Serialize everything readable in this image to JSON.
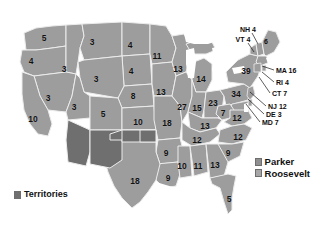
{
  "map": {
    "title": "1904 United States presidential election electoral map",
    "colors": {
      "roosevelt": "#9d9d9d",
      "parker": "#9d9d9d",
      "territories": "#6f6f6f",
      "background": "#ffffff",
      "border": "#e8e8e8",
      "text": "#111111"
    },
    "states": [
      {
        "name": "washington",
        "label": "5",
        "x": 44,
        "y": 38
      },
      {
        "name": "oregon",
        "label": "4",
        "x": 31,
        "y": 61
      },
      {
        "name": "idaho",
        "label": "3",
        "x": 64,
        "y": 69
      },
      {
        "name": "montana",
        "label": "3",
        "x": 92,
        "y": 42
      },
      {
        "name": "north-dakota",
        "label": "4",
        "x": 130,
        "y": 45
      },
      {
        "name": "south-dakota",
        "label": "4",
        "x": 131,
        "y": 71
      },
      {
        "name": "nebraska",
        "label": "8",
        "x": 133,
        "y": 96
      },
      {
        "name": "wyoming",
        "label": "3",
        "x": 96,
        "y": 79
      },
      {
        "name": "nevada",
        "label": "3",
        "x": 48,
        "y": 98
      },
      {
        "name": "california",
        "label": "10",
        "x": 33,
        "y": 119
      },
      {
        "name": "utah",
        "label": "3",
        "x": 74,
        "y": 107
      },
      {
        "name": "colorado",
        "label": "5",
        "x": 103,
        "y": 114
      },
      {
        "name": "kansas",
        "label": "10",
        "x": 138,
        "y": 122
      },
      {
        "name": "minnesota",
        "label": "11",
        "x": 157,
        "y": 56
      },
      {
        "name": "iowa",
        "label": "13",
        "x": 161,
        "y": 92
      },
      {
        "name": "missouri",
        "label": "18",
        "x": 167,
        "y": 123
      },
      {
        "name": "wisconsin",
        "label": "13",
        "x": 178,
        "y": 69
      },
      {
        "name": "michigan",
        "label": "14",
        "x": 201,
        "y": 79
      },
      {
        "name": "illinois",
        "label": "27",
        "x": 182,
        "y": 107
      },
      {
        "name": "indiana",
        "label": "15",
        "x": 197,
        "y": 108
      },
      {
        "name": "ohio",
        "label": "23",
        "x": 213,
        "y": 103
      },
      {
        "name": "pennsylvania",
        "label": "34",
        "x": 236,
        "y": 94
      },
      {
        "name": "new-york",
        "label": "39",
        "x": 246,
        "y": 71
      },
      {
        "name": "west-virginia",
        "label": "7",
        "x": 223,
        "y": 113
      },
      {
        "name": "virginia",
        "label": "12",
        "x": 237,
        "y": 118
      },
      {
        "name": "kentucky",
        "label": "13",
        "x": 205,
        "y": 126
      },
      {
        "name": "tennessee",
        "label": "12",
        "x": 197,
        "y": 140
      },
      {
        "name": "north-carolina",
        "label": "12",
        "x": 238,
        "y": 137
      },
      {
        "name": "south-carolina",
        "label": "9",
        "x": 228,
        "y": 153
      },
      {
        "name": "arkansas",
        "label": "9",
        "x": 166,
        "y": 153
      },
      {
        "name": "louisiana",
        "label": "9",
        "x": 168,
        "y": 178
      },
      {
        "name": "mississippi",
        "label": "10",
        "x": 182,
        "y": 166
      },
      {
        "name": "alabama",
        "label": "11",
        "x": 198,
        "y": 166
      },
      {
        "name": "georgia",
        "label": "13",
        "x": 215,
        "y": 165
      },
      {
        "name": "florida",
        "label": "5",
        "x": 229,
        "y": 199
      },
      {
        "name": "texas",
        "label": "18",
        "x": 135,
        "y": 181
      }
    ],
    "callouts": [
      {
        "name": "new-hampshire",
        "label": "NH 4",
        "x": 248,
        "y": 29,
        "align": "center",
        "line": {
          "x1": 252,
          "y1": 33,
          "x2": 258,
          "y2": 44
        }
      },
      {
        "name": "vermont",
        "label": "VT 4",
        "x": 243,
        "y": 39,
        "align": "center",
        "line": {
          "x1": 248,
          "y1": 43,
          "x2": 254,
          "y2": 52
        }
      },
      {
        "name": "maine",
        "label": "6",
        "x": 266,
        "y": 41,
        "align": "center",
        "line": null
      },
      {
        "name": "massachusetts",
        "label": "MA 16",
        "x": 276,
        "y": 70,
        "align": "right",
        "line": {
          "x1": 274,
          "y1": 70,
          "x2": 262,
          "y2": 66
        }
      },
      {
        "name": "rhode-island",
        "label": "RI 4",
        "x": 276,
        "y": 82,
        "align": "right",
        "line": {
          "x1": 274,
          "y1": 82,
          "x2": 262,
          "y2": 72
        }
      },
      {
        "name": "connecticut",
        "label": "CT 7",
        "x": 272,
        "y": 93,
        "align": "right",
        "line": {
          "x1": 270,
          "y1": 93,
          "x2": 259,
          "y2": 77
        }
      },
      {
        "name": "new-jersey",
        "label": "NJ 12",
        "x": 268,
        "y": 106,
        "align": "right",
        "line": {
          "x1": 266,
          "y1": 106,
          "x2": 250,
          "y2": 92
        }
      },
      {
        "name": "delaware",
        "label": "DE 3",
        "x": 266,
        "y": 114,
        "align": "right",
        "line": {
          "x1": 264,
          "y1": 114,
          "x2": 248,
          "y2": 99
        }
      },
      {
        "name": "maryland",
        "label": "MD 7",
        "x": 262,
        "y": 122,
        "align": "right",
        "line": {
          "x1": 260,
          "y1": 122,
          "x2": 246,
          "y2": 104
        }
      }
    ],
    "legend": {
      "candidates": [
        {
          "name": "parker",
          "label": "Parker",
          "swatch": "#8f8f8f"
        },
        {
          "name": "roosevelt",
          "label": "Roosevelt",
          "swatch": "#a6a6a6"
        }
      ],
      "territories": {
        "label": "Territories",
        "swatch": "#6f6f6f"
      }
    }
  }
}
